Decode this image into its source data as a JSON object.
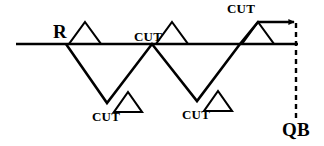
{
  "diagram": {
    "type": "football-route-tree",
    "line_color": "#000000",
    "background_color": "#ffffff",
    "labels": {
      "receiver": "R",
      "quarterback": "QB",
      "cut_mid": "CUT",
      "cut_top": "CUT",
      "cut_bottom_left": "CUT",
      "cut_bottom_right": "CUT"
    },
    "geometry": {
      "line_of_scrimmage": {
        "x1": 16,
        "y": 44,
        "x2": 298
      },
      "route_path": "66,44 107,103 152,44 197,101 240,44 258,22 296,22",
      "arrow_tip": {
        "x": 296,
        "y": 22
      },
      "dashed_connector": {
        "x": 296,
        "y_start": 22,
        "y_end": 118
      },
      "markers": [
        {
          "name": "triangle-start",
          "apex_x": 85,
          "apex_y": 22,
          "base_y": 44,
          "half_width": 16
        },
        {
          "name": "triangle-mid",
          "apex_x": 172,
          "apex_y": 22,
          "base_y": 44,
          "half_width": 16
        },
        {
          "name": "triangle-top-right",
          "apex_x": 258,
          "apex_y": 22,
          "base_y": 44,
          "half_width": 16
        },
        {
          "name": "triangle-bottom-left",
          "apex_x": 128,
          "apex_y": 92,
          "base_y": 112,
          "half_width": 14
        },
        {
          "name": "triangle-bottom-right",
          "apex_x": 218,
          "apex_y": 91,
          "base_y": 111,
          "half_width": 14
        }
      ]
    }
  }
}
